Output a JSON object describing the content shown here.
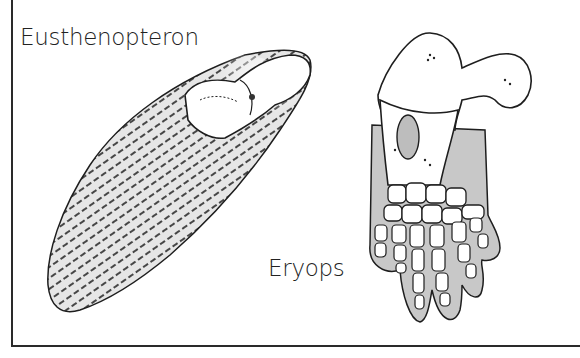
{
  "figure": {
    "specimens": [
      {
        "id": "eusthenopteron",
        "label": "Eusthenopteron",
        "part": "fin"
      },
      {
        "id": "eryops",
        "label": "Eryops",
        "part": "forelimb"
      }
    ]
  },
  "colors": {
    "ink": "#222222",
    "shading": "#c8c8c8",
    "background": "#ffffff"
  }
}
